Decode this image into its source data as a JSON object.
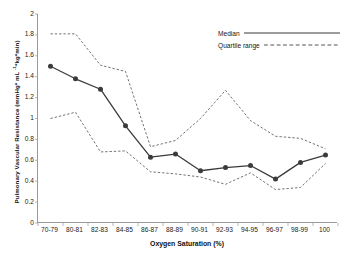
{
  "chart_data": {
    "type": "line",
    "title": "",
    "xlabel": "Oxygen Saturation (%)",
    "ylabel": "Pulmonary Vascular Resistance (mmHg* mL -1*kg*min)",
    "ylabel_parts": {
      "main": "Pulmonary Vascular Resistance (mmHg* mL ",
      "sup": "-1",
      "tail": "*kg*min)"
    },
    "categories": [
      "70-79",
      "80-81",
      "82-83",
      "84-85",
      "86-87",
      "88-89",
      "90-91",
      "92-93",
      "94-95",
      "96-97",
      "98-99",
      "100"
    ],
    "ylim": [
      0,
      2
    ],
    "ytick_labels": [
      "2",
      "1.8",
      "1.6",
      "1.4",
      "1.2",
      "1",
      "0.8",
      "0.6",
      "0.4",
      "0.2",
      "0"
    ],
    "ytick_values": [
      2,
      1.8,
      1.6,
      1.4,
      1.2,
      1,
      0.8,
      0.6,
      0.4,
      0.2,
      0
    ],
    "grid": false,
    "legend_position": "top-right",
    "series": [
      {
        "name": "Median",
        "style": "solid",
        "marker": "circle",
        "color": "#3b3b3b",
        "values": [
          1.5,
          1.38,
          1.28,
          0.93,
          0.63,
          0.66,
          0.5,
          0.53,
          0.55,
          0.42,
          0.58,
          0.65
        ]
      },
      {
        "name": "Quartile range upper",
        "style": "dashed",
        "marker": "none",
        "color": "#5a5a5a",
        "values": [
          1.81,
          1.81,
          1.51,
          1.45,
          0.73,
          0.79,
          1.0,
          1.27,
          0.98,
          0.83,
          0.81,
          0.71
        ]
      },
      {
        "name": "Quartile range lower",
        "style": "dashed",
        "marker": "none",
        "color": "#5a5a5a",
        "values": [
          1.0,
          1.06,
          0.68,
          0.69,
          0.49,
          0.47,
          0.44,
          0.37,
          0.48,
          0.32,
          0.34,
          0.57
        ]
      }
    ]
  },
  "legend": {
    "items": [
      {
        "label": "Median",
        "style": "solid"
      },
      {
        "label": "Quartile range",
        "style": "dashed"
      }
    ]
  }
}
